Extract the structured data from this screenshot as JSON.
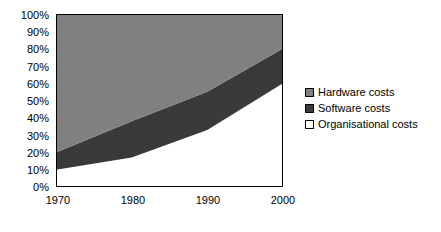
{
  "chart_data": {
    "type": "area",
    "stacked": true,
    "percent_stacked": true,
    "title": "",
    "subtitle": "",
    "xlabel": "",
    "ylabel": "",
    "x": [
      1970,
      1980,
      1990,
      2000
    ],
    "xlim": [
      1970,
      2000
    ],
    "ylim": [
      0,
      100
    ],
    "ytick_labels": [
      "0%",
      "10%",
      "20%",
      "30%",
      "40%",
      "50%",
      "60%",
      "70%",
      "80%",
      "90%",
      "100%"
    ],
    "ytick_values": [
      0,
      10,
      20,
      30,
      40,
      50,
      60,
      70,
      80,
      90,
      100
    ],
    "xtick_labels": [
      "1970",
      "1980",
      "1990",
      "2000"
    ],
    "xtick_values": [
      1970,
      1980,
      1990,
      2000
    ],
    "grid": false,
    "legend_position": "right",
    "series": [
      {
        "name": "Hardware costs",
        "color": "#808080",
        "stack_order": 3,
        "values": [
          80,
          62,
          45,
          20
        ],
        "cumulative_top": [
          100,
          100,
          100,
          100
        ]
      },
      {
        "name": "Software costs",
        "color": "#3a3a3a",
        "stack_order": 2,
        "values": [
          10,
          21,
          22,
          20
        ],
        "cumulative_top": [
          20,
          38,
          55,
          80
        ]
      },
      {
        "name": "Organisational costs",
        "color": "#ffffff",
        "stack_order": 1,
        "values": [
          10,
          17,
          33,
          60
        ],
        "cumulative_top": [
          10,
          17,
          33,
          60
        ]
      }
    ]
  },
  "legend": {
    "items": [
      {
        "label": "Hardware costs",
        "color": "#808080"
      },
      {
        "label": "Software costs",
        "color": "#3a3a3a"
      },
      {
        "label": "Organisational costs",
        "color": "#ffffff"
      }
    ]
  },
  "axes": {
    "y_ticks": [
      "100%",
      "90%",
      "80%",
      "70%",
      "60%",
      "50%",
      "40%",
      "30%",
      "20%",
      "10%",
      "0%"
    ],
    "x_ticks": [
      "1970",
      "1980",
      "1990",
      "2000"
    ]
  },
  "colors": {
    "hardware": "#808080",
    "software": "#3a3a3a",
    "organisational": "#ffffff",
    "axis": "#000000",
    "background": "#ffffff"
  }
}
